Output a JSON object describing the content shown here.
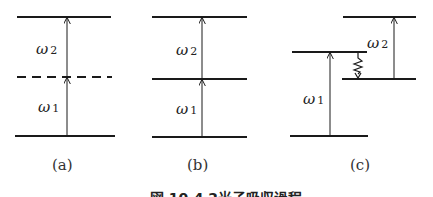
{
  "figure": {
    "caption": "図 10.4  2光子吸収過程",
    "panels": [
      {
        "id": "a",
        "label": "(a)",
        "levels": [
          "ground",
          "virtual (dashed)",
          "excited"
        ],
        "transitions": [
          {
            "symbol": "ω",
            "subscript": "1"
          },
          {
            "symbol": "ω",
            "subscript": "2"
          }
        ]
      },
      {
        "id": "b",
        "label": "(b)",
        "levels": [
          "ground",
          "real intermediate",
          "excited"
        ],
        "transitions": [
          {
            "symbol": "ω",
            "subscript": "1"
          },
          {
            "symbol": "ω",
            "subscript": "2"
          }
        ]
      },
      {
        "id": "c",
        "label": "(c)",
        "levels": [
          "ground",
          "intermediate",
          "relaxed intermediate",
          "excited"
        ],
        "transitions": [
          {
            "symbol": "ω",
            "subscript": "1"
          },
          {
            "symbol": "ω",
            "subscript": "2"
          }
        ],
        "relaxation": "wavy arrow (non-radiative)"
      }
    ]
  },
  "colors": {
    "line": "#1a1a1a",
    "text": "#222222",
    "background": "#ffffff"
  }
}
